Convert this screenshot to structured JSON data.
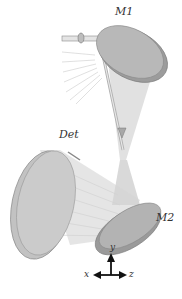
{
  "diagram": {
    "labels": {
      "m1": "M1",
      "m2": "M2",
      "det": "Det"
    },
    "axes": {
      "x": "x",
      "y": "y",
      "z": "z"
    },
    "colors": {
      "mirror_face": "#b5b5b5",
      "mirror_rim": "#9a9a9a",
      "beam": "#c8c8c8",
      "ray": "#d6d6d6",
      "outline": "#7a7a7a",
      "axis": "#111111"
    }
  }
}
